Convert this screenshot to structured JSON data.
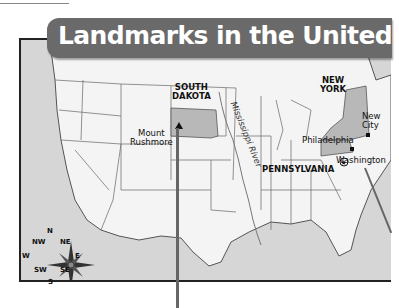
{
  "title": "Landmarks in the United States",
  "map": {
    "states_highlighted": [
      {
        "name": "SOUTH DAKOTA",
        "line1": "SOUTH",
        "line2": "DAKOTA",
        "fill": "#b8b8b8"
      },
      {
        "name": "NEW YORK",
        "line1": "NEW",
        "line2": "YORK",
        "fill": "#b8b8b8"
      },
      {
        "name": "PENNSYLVANIA",
        "fill": "#b8b8b8"
      }
    ],
    "labels": {
      "south_dakota_1": "SOUTH",
      "south_dakota_2": "DAKOTA",
      "new_york_1": "NEW",
      "new_york_2": "YORK",
      "pennsylvania": "PENNSYLVANIA",
      "mount_rushmore_1": "Mount",
      "mount_rushmore_2": "Rushmore",
      "philadelphia": "Philadelphia",
      "new_city_1": "New",
      "new_city_2": "City",
      "washington": "Washington",
      "mississippi_river": "Mississippi River"
    },
    "landmarks": [
      {
        "name": "Mount Rushmore",
        "symbol": "triangle"
      },
      {
        "name": "Philadelphia",
        "symbol": "square"
      },
      {
        "name": "New York City",
        "symbol": "square"
      },
      {
        "name": "Washington",
        "symbol": "star-in-circle"
      }
    ],
    "colors": {
      "water": "#d6d6d6",
      "land": "#f4f4f4",
      "highlight": "#b8b8b8",
      "banner": "#6a6a6a",
      "border": "#555555"
    }
  },
  "compass": {
    "n": "N",
    "ne": "NE",
    "e": "E",
    "se": "SE",
    "s": "S",
    "sw": "SW",
    "w": "W",
    "nw": "NW"
  }
}
